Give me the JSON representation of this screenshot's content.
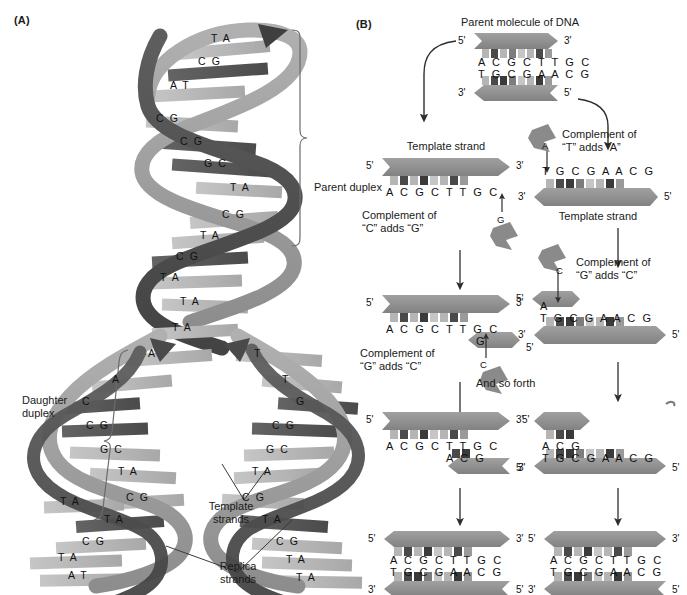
{
  "figure": {
    "type": "diagram",
    "panels": [
      "(A)",
      "(B)"
    ]
  },
  "panelA": {
    "letter": "(A)",
    "labels": {
      "parent_duplex": "Parent duplex",
      "daughter_duplex_line1": "Daughter",
      "daughter_duplex_line2": "duplex",
      "template_strands_line1": "Template",
      "template_strands_line2": "strands",
      "replica_strands_line1": "Replica",
      "replica_strands_line2": "strands"
    },
    "parent_base_pairs": [
      "T A",
      "C G",
      "A T",
      "C G",
      "C G",
      "G C",
      "T A",
      "C G",
      "T A",
      "C G",
      "T A",
      "T A"
    ],
    "fork_unpaired": {
      "left": [
        "A",
        "A",
        "C"
      ],
      "right": [
        "T",
        "T",
        "G"
      ]
    },
    "left_daughter_base_pairs": [
      "C G",
      "G C",
      "T A",
      "C G",
      "T A",
      "C G",
      "T A",
      "T A",
      "A T"
    ],
    "right_daughter_base_pairs": [
      "C G",
      "G C",
      "T A",
      "C G",
      "T A",
      "C G",
      "T A",
      "T A",
      "A T"
    ],
    "colors": {
      "ribbon_light": "#9a9a9a",
      "ribbon_dark": "#4f4f4f",
      "rung_light": "#b9b9b9",
      "rung_dark": "#585858"
    }
  },
  "panelB": {
    "letter": "(B)",
    "title": "Parent molecule of DNA",
    "footer": "Daughter molecules of DNA",
    "and_so_forth": "And so forth",
    "polarity": {
      "five": "5'",
      "three": "3'"
    },
    "parent": {
      "top_strand": "A C G C T T G C",
      "bottom_strand": "T G C G A A C G",
      "top_left_end": "5'",
      "top_right_end": "3'",
      "bottom_left_end": "3'",
      "bottom_right_end": "5'"
    },
    "row2": {
      "left": {
        "heading": "Template strand",
        "template_seq": "A C G C T T G C",
        "left_end": "5'",
        "right_end": "3'",
        "caption_line1": "Complement of",
        "caption_line2": "“C” adds “G”",
        "incoming_nucleotide": "G"
      },
      "right": {
        "heading": "Template strand",
        "template_seq": "T G C G A A C G",
        "left_end": "3'",
        "right_end": "5'",
        "caption_line1": "Complement of",
        "caption_line2": "“T” adds “A”",
        "incoming_nucleotide": "A"
      }
    },
    "row3": {
      "left": {
        "template_seq": "A C G C T T G C",
        "new_seq": "G",
        "left_end": "5'",
        "right_end": "3'",
        "new_strand_end": "5'",
        "caption_line1": "Complement of",
        "caption_line2": "“G” adds “C”",
        "incoming_nucleotide": "C"
      },
      "right": {
        "template_seq": "T G C G A A C G",
        "new_seq": "A",
        "left_end": "3'",
        "right_end": "5'",
        "new_strand_end": "5'",
        "caption_line1": "Complement of",
        "caption_line2": "“G” adds “C”",
        "incoming_nucleotide": "C"
      }
    },
    "row4": {
      "left": {
        "template_seq": "A C G C T T G C",
        "new_seq": "A C G",
        "left_end": "5'",
        "right_end": "3'",
        "new_strand_end": "5'"
      },
      "right": {
        "template_seq": "T G C G A A C G",
        "new_seq": "A C G",
        "left_end": "3'",
        "right_end": "5'",
        "new_strand_end": "5'"
      }
    },
    "row5": {
      "left": {
        "top_strand": "A C G C T T G C",
        "bottom_strand": "T G C G A A C G",
        "top_left_end": "5'",
        "top_right_end": "3'",
        "bottom_left_end": "3'",
        "bottom_right_end": "5'"
      },
      "right": {
        "top_strand": "A C G C T T G C",
        "bottom_strand": "T G C G A A C G",
        "top_left_end": "5'",
        "top_right_end": "3'",
        "bottom_left_end": "3'",
        "bottom_right_end": "5'"
      }
    },
    "colors": {
      "strand": "#8f8f8f",
      "strand_dark": "#7a7a7a",
      "tick_dark": "#4a4a4a",
      "tick_light": "#b5b5b5",
      "arrow": "#2e2e2e"
    }
  }
}
